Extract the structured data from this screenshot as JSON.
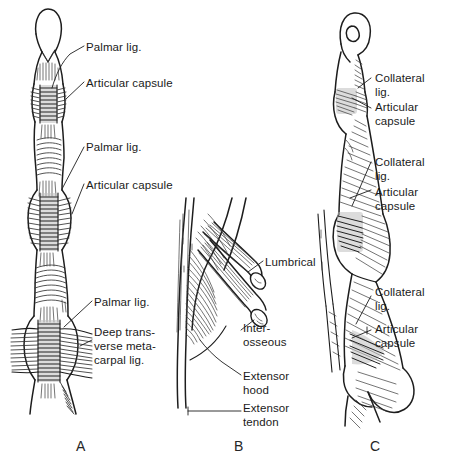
{
  "figure": {
    "background_color": "#ffffff",
    "ink_color": "#1a1a1a",
    "width": 449,
    "height": 466
  },
  "panels": [
    {
      "id": "A",
      "letter": "A",
      "view": "palmar-view-of-finger",
      "letter_x": 76,
      "letter_y": 438,
      "labels": [
        {
          "name": "palmar-lig-distal",
          "text": "Palmar lig.",
          "x": 86,
          "y": 40
        },
        {
          "name": "articular-capsule-dip",
          "text": "Articular capsule",
          "x": 86,
          "y": 76
        },
        {
          "name": "palmar-lig-middle",
          "text": "Palmar lig.",
          "x": 86,
          "y": 140
        },
        {
          "name": "articular-capsule-pip",
          "text": "Articular capsule",
          "x": 86,
          "y": 178
        },
        {
          "name": "palmar-lig-proximal",
          "text": "Palmar lig.",
          "x": 94,
          "y": 295
        },
        {
          "name": "deep-transverse-metacarpal-lig",
          "text": "Deep trans-\nverse meta-\ncarpal lig.",
          "x": 94,
          "y": 325
        }
      ]
    },
    {
      "id": "B",
      "letter": "B",
      "view": "extensor-hood-oblique-view",
      "letter_x": 234,
      "letter_y": 438,
      "labels": [
        {
          "name": "lumbrical",
          "text": "Lumbrical",
          "x": 265,
          "y": 255
        },
        {
          "name": "interosseous",
          "text": "Inter-\nosseous",
          "x": 243,
          "y": 321
        },
        {
          "name": "extensor-hood",
          "text": "Extensor\nhood",
          "x": 243,
          "y": 369
        },
        {
          "name": "extensor-tendon",
          "text": "Extensor\ntendon",
          "x": 243,
          "y": 401
        }
      ]
    },
    {
      "id": "C",
      "letter": "C",
      "view": "lateral-view-of-finger",
      "letter_x": 370,
      "letter_y": 438,
      "labels": [
        {
          "name": "collateral-lig-dip",
          "text": "Collateral\nlig.",
          "x": 375,
          "y": 71
        },
        {
          "name": "articular-capsule-dip",
          "text": "Articular\ncapsule",
          "x": 375,
          "y": 100
        },
        {
          "name": "collateral-lig-pip",
          "text": "Collateral\nlig.",
          "x": 375,
          "y": 155
        },
        {
          "name": "articular-capsule-pip",
          "text": "Articular\ncapsule",
          "x": 375,
          "y": 185
        },
        {
          "name": "collateral-lig-mcp",
          "text": "Collateral\nlig.",
          "x": 375,
          "y": 285
        },
        {
          "name": "articular-capsule-mcp",
          "text": "Articular\ncapsule",
          "x": 375,
          "y": 322
        }
      ]
    }
  ]
}
